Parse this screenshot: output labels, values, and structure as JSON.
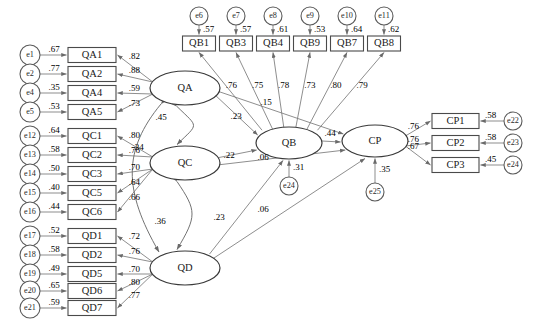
{
  "diagram": {
    "type": "sem-path-diagram",
    "latents": [
      {
        "id": "QA",
        "label": "QA",
        "cx": 185,
        "cy": 88,
        "rx": 35,
        "ry": 17
      },
      {
        "id": "QC",
        "label": "QC",
        "cx": 185,
        "cy": 163,
        "rx": 35,
        "ry": 17
      },
      {
        "id": "QD",
        "label": "QD",
        "cx": 185,
        "cy": 268,
        "rx": 35,
        "ry": 17
      },
      {
        "id": "QB",
        "label": "QB",
        "cx": 289,
        "cy": 143,
        "rx": 33,
        "ry": 16
      },
      {
        "id": "CP",
        "label": "CP",
        "cx": 375,
        "cy": 141,
        "rx": 33,
        "ry": 16
      }
    ],
    "left_indicators": [
      {
        "err": "e1",
        "box": "QA1",
        "err_val": ".67",
        "load": ".82",
        "y": 55
      },
      {
        "err": "e2",
        "box": "QA2",
        "err_val": ".77",
        "load": ".88",
        "y": 74
      },
      {
        "err": "e4",
        "box": "QA4",
        "err_val": ".35",
        "load": ".59",
        "y": 93
      },
      {
        "err": "e5",
        "box": "QA5",
        "err_val": ".53",
        "load": ".73",
        "y": 112
      },
      {
        "err": "e12",
        "box": "QC1",
        "err_val": ".64",
        "load": ".80",
        "y": 136
      },
      {
        "err": "e13",
        "box": "QC2",
        "err_val": ".58",
        "load": ".76",
        "y": 155
      },
      {
        "err": "e14",
        "box": "QC3",
        "err_val": ".50",
        "load": ".70",
        "y": 174
      },
      {
        "err": "e15",
        "box": "QC5",
        "err_val": ".40",
        "load": ".64",
        "y": 193
      },
      {
        "err": "e16",
        "box": "QC6",
        "err_val": ".44",
        "load": ".66",
        "y": 212
      },
      {
        "err": "e17",
        "box": "QD1",
        "err_val": ".52",
        "load": ".72",
        "y": 236
      },
      {
        "err": "e18",
        "box": "QD2",
        "err_val": ".58",
        "load": ".76",
        "y": 255
      },
      {
        "err": "e19",
        "box": "QD5",
        "err_val": ".49",
        "load": ".70",
        "y": 274
      },
      {
        "err": "e20",
        "box": "QD6",
        "err_val": ".65",
        "load": ".80",
        "y": 291
      },
      {
        "err": "e21",
        "box": "QD7",
        "err_val": ".59",
        "load": ".77",
        "y": 308
      }
    ],
    "left_groups": [
      {
        "latent": "QA",
        "from": 0,
        "to": 3
      },
      {
        "latent": "QC",
        "from": 4,
        "to": 8
      },
      {
        "latent": "QD",
        "from": 9,
        "to": 13
      }
    ],
    "top_indicators": [
      {
        "err": "e6",
        "box": "QB1",
        "err_val": ".57",
        "load": ".76",
        "x": 199
      },
      {
        "err": "e7",
        "box": "QB3",
        "err_val": ".57",
        "load": ".75",
        "x": 236
      },
      {
        "err": "e8",
        "box": "QB4",
        "err_val": ".61",
        "load": ".78",
        "x": 273
      },
      {
        "err": "e9",
        "box": "QB9",
        "err_val": ".53",
        "load": ".73",
        "x": 310
      },
      {
        "err": "e10",
        "box": "QB7",
        "err_val": ".64",
        "load": ".80",
        "x": 347
      },
      {
        "err": "e11",
        "box": "QB8",
        "err_val": ".62",
        "load": ".79",
        "x": 384
      }
    ],
    "right_indicators": [
      {
        "err": "e22",
        "box": "CP1",
        "err_val": ".58",
        "load": ".76",
        "y": 121
      },
      {
        "err": "e23",
        "box": "CP2",
        "err_val": ".58",
        "load": ".76",
        "y": 143
      },
      {
        "err": "e24",
        "box": "CP3",
        "err_val": ".45",
        "load": ".67",
        "y": 165
      }
    ],
    "disturbances": [
      {
        "err": "e24",
        "target": "QB",
        "val": ".31",
        "cx": 289,
        "cy": 186
      },
      {
        "err": "e25",
        "target": "CP",
        "val": ".35",
        "cx": 375,
        "cy": 192
      }
    ],
    "structural_paths": [
      {
        "from": "QA",
        "to": "QB",
        "val": ".23"
      },
      {
        "from": "QC",
        "to": "QB",
        "val": ".22"
      },
      {
        "from": "QD",
        "to": "QB",
        "val": ".23"
      },
      {
        "from": "QA",
        "to": "CP",
        "val": ".15"
      },
      {
        "from": "QC",
        "to": "CP",
        "val": ".06"
      },
      {
        "from": "QD",
        "to": "CP",
        "val": ".06"
      },
      {
        "from": "QB",
        "to": "CP",
        "val": ".44"
      }
    ],
    "correlations": [
      {
        "a": "QA",
        "b": "QC",
        "val": ".45"
      },
      {
        "a": "QA",
        "b": "QD",
        "val": ".34"
      },
      {
        "a": "QC",
        "b": "QD",
        "val": ".36"
      }
    ]
  }
}
